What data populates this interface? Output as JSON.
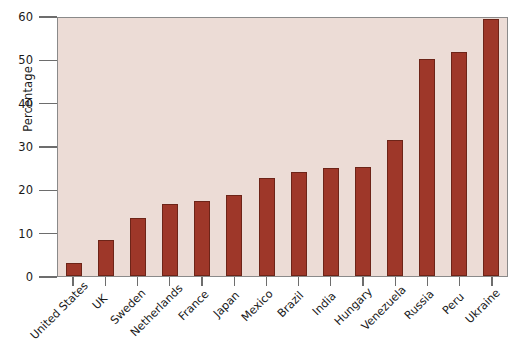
{
  "chart_data": {
    "type": "bar",
    "title": "",
    "xlabel": "",
    "ylabel": "Percentage",
    "ylim": [
      0,
      60
    ],
    "yticks": [
      0,
      10,
      20,
      30,
      40,
      50,
      60
    ],
    "grid": false,
    "legend": null,
    "bar_color": "#9e3729",
    "plot_background": "#ecdcd6",
    "categories": [
      "United States",
      "UK",
      "Sweden",
      "Netherlands",
      "France",
      "Japan",
      "Mexico",
      "Brazil",
      "India",
      "Hungary",
      "Venezuela",
      "Russia",
      "Peru",
      "Ukraine"
    ],
    "values": [
      3.1,
      8.2,
      13.5,
      16.6,
      17.4,
      18.7,
      22.6,
      24.1,
      25.0,
      25.2,
      31.3,
      50.0,
      51.7,
      59.2
    ]
  }
}
